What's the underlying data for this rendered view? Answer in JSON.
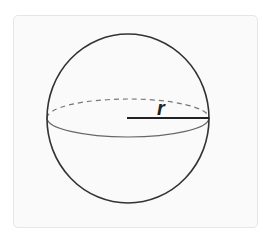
{
  "figure": {
    "radius_label": "r",
    "colors": {
      "background": "#ffffff",
      "panel": "#fafafa",
      "panel_border": "#e6e6e6",
      "outline": "#333333",
      "equator": "#666666"
    }
  }
}
